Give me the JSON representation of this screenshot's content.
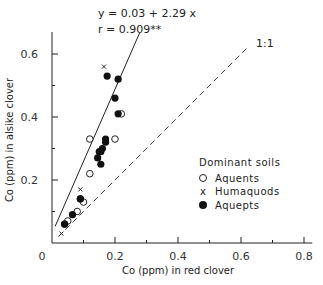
{
  "chart_data": {
    "type": "scatter",
    "title": "",
    "xlabel": "Co (ppm) in red clover",
    "ylabel": "Co (ppm) in alsike clover",
    "xlim": [
      0,
      0.82
    ],
    "ylim": [
      0,
      0.67
    ],
    "x_ticks": [
      "0",
      "0.2",
      "0.4",
      "0.6",
      "0.8"
    ],
    "x_tick_values": [
      0,
      0.2,
      0.4,
      0.6,
      0.8
    ],
    "x_minor_ticks": [
      0.1,
      0.3,
      0.5,
      0.7
    ],
    "y_ticks": [
      "0.2",
      "0.4",
      "0.6"
    ],
    "y_tick_values": [
      0.2,
      0.4,
      0.6
    ],
    "y_minor_ticks": [
      0.1,
      0.3,
      0.5
    ],
    "grid": false,
    "legend_title": "Dominant soils",
    "legend_position": "lower right (inside)",
    "annotations": {
      "equation": "y = 0.03 + 2.29 x",
      "r_value": "r = 0.909**",
      "identity_label": "1:1"
    },
    "regression_line": {
      "intercept": 0.03,
      "slope": 2.29,
      "x_range": [
        0.01,
        0.278
      ]
    },
    "identity_line": {
      "x_range": [
        0.02,
        0.62
      ],
      "style": "dashed"
    },
    "series": [
      {
        "name": "Aquents",
        "marker": "open-circle",
        "points": [
          [
            0.22,
            0.41
          ],
          [
            0.12,
            0.33
          ],
          [
            0.2,
            0.33
          ],
          [
            0.12,
            0.22
          ],
          [
            0.1,
            0.13
          ],
          [
            0.09,
            0.14
          ],
          [
            0.08,
            0.1
          ],
          [
            0.05,
            0.07
          ],
          [
            0.04,
            0.06
          ]
        ]
      },
      {
        "name": "Humaquods",
        "marker": "x",
        "points": [
          [
            0.165,
            0.56
          ],
          [
            0.09,
            0.17
          ],
          [
            0.03,
            0.03
          ]
        ]
      },
      {
        "name": "Aquepts",
        "marker": "filled-circle",
        "points": [
          [
            0.175,
            0.53
          ],
          [
            0.21,
            0.52
          ],
          [
            0.2,
            0.46
          ],
          [
            0.21,
            0.41
          ],
          [
            0.17,
            0.33
          ],
          [
            0.17,
            0.32
          ],
          [
            0.16,
            0.3
          ],
          [
            0.155,
            0.29
          ],
          [
            0.15,
            0.29
          ],
          [
            0.145,
            0.27
          ],
          [
            0.155,
            0.25
          ],
          [
            0.09,
            0.14
          ],
          [
            0.065,
            0.09
          ],
          [
            0.04,
            0.06
          ]
        ]
      }
    ]
  }
}
